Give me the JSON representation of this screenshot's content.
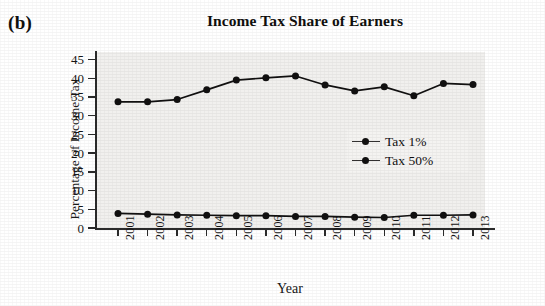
{
  "panel": {
    "letter": "(b)"
  },
  "chart_data": {
    "type": "line",
    "title": "Income Tax Share of Earners",
    "xlabel": "Year",
    "ylabel": "Percentage of Income Tax",
    "categories": [
      "2001",
      "2002",
      "2003",
      "2004",
      "2005",
      "2006",
      "2007",
      "2008",
      "2009",
      "2010",
      "2011",
      "2012",
      "2013"
    ],
    "ylim": [
      0,
      47
    ],
    "yticks": [
      0,
      5,
      10,
      15,
      20,
      25,
      30,
      35,
      40,
      45
    ],
    "ytick_labels": [
      "0",
      "5",
      "10",
      "15",
      "20",
      "25",
      "30",
      "35",
      "40",
      "45"
    ],
    "grid": false,
    "legend_position": "center-right",
    "series": [
      {
        "name": "Tax 1%",
        "color": "#111010",
        "marker": "circle",
        "values": [
          3.9,
          3.7,
          3.5,
          3.4,
          3.3,
          3.3,
          3.1,
          3.1,
          2.9,
          2.8,
          3.4,
          3.4,
          3.5
        ]
      },
      {
        "name": "Tax 50%",
        "color": "#111010",
        "marker": "circle",
        "values": [
          33.7,
          33.7,
          34.3,
          36.9,
          39.5,
          40.1,
          40.6,
          38.2,
          36.6,
          37.7,
          35.3,
          38.6,
          38.3
        ]
      }
    ]
  },
  "legend": {
    "entries": [
      {
        "label": "Tax 1%"
      },
      {
        "label": "Tax 50%"
      }
    ]
  }
}
